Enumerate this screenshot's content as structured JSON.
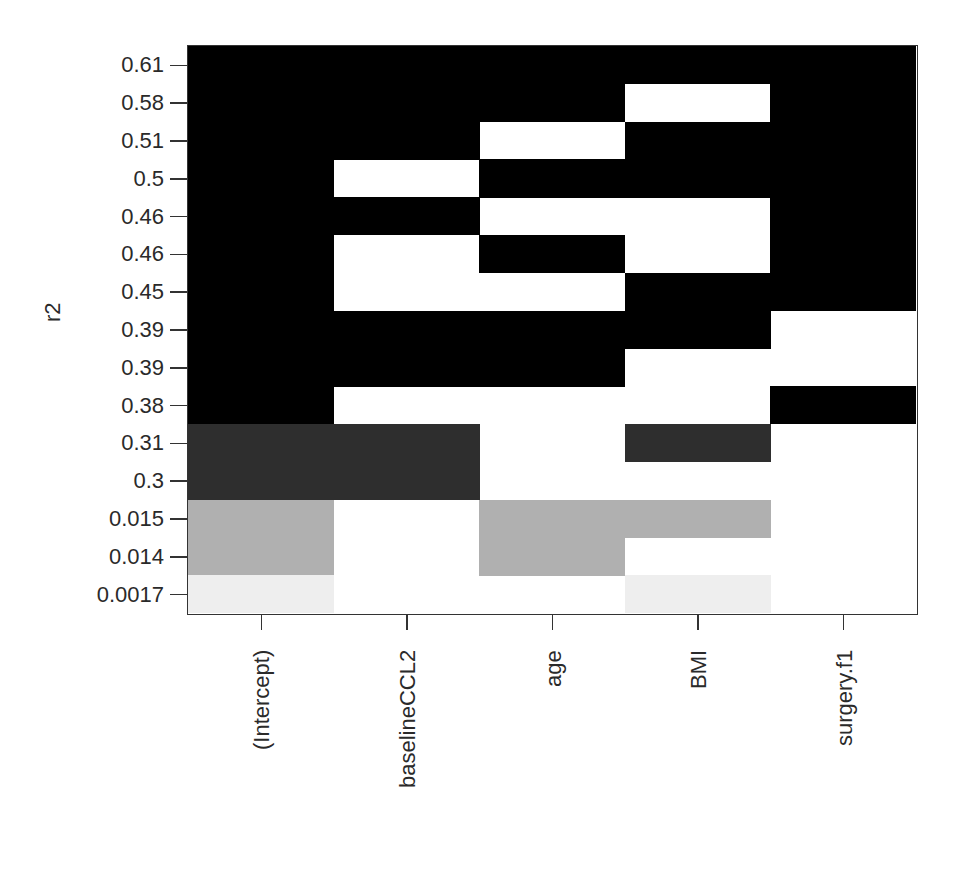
{
  "chart_data": {
    "type": "heatmap",
    "title": "",
    "xlabel": "",
    "ylabel": "r2",
    "columns": [
      "(Intercept)",
      "baselineCCL2",
      "age",
      "BMI",
      "surgery.f1"
    ],
    "rows": [
      "0.61",
      "0.58",
      "0.51",
      "0.5",
      "0.46",
      "0.46",
      "0.45",
      "0.39",
      "0.39",
      "0.38",
      "0.31",
      "0.3",
      "0.015",
      "0.014",
      "0.0017"
    ],
    "included": [
      [
        1,
        1,
        1,
        1,
        1
      ],
      [
        1,
        1,
        1,
        0,
        1
      ],
      [
        1,
        1,
        0,
        1,
        1
      ],
      [
        1,
        0,
        1,
        1,
        1
      ],
      [
        1,
        1,
        0,
        0,
        1
      ],
      [
        1,
        0,
        1,
        0,
        1
      ],
      [
        1,
        0,
        0,
        1,
        1
      ],
      [
        1,
        1,
        1,
        1,
        0
      ],
      [
        1,
        1,
        1,
        0,
        0
      ],
      [
        1,
        0,
        0,
        0,
        1
      ],
      [
        1,
        1,
        0,
        1,
        0
      ],
      [
        1,
        1,
        0,
        0,
        0
      ],
      [
        1,
        0,
        1,
        1,
        0
      ],
      [
        1,
        0,
        1,
        0,
        0
      ],
      [
        1,
        0,
        0,
        1,
        0
      ]
    ],
    "row_shades": [
      "#000000",
      "#000000",
      "#000000",
      "#000000",
      "#000000",
      "#000000",
      "#000000",
      "#000000",
      "#000000",
      "#000000",
      "#2e2e2e",
      "#2e2e2e",
      "#b0b0b0",
      "#b0b0b0",
      "#eeeeee"
    ],
    "legend": null,
    "grid": false
  },
  "axis": {
    "ylabel": "r2",
    "yticks": [
      "0.61",
      "0.58",
      "0.51",
      "0.5",
      "0.46",
      "0.46",
      "0.45",
      "0.39",
      "0.39",
      "0.38",
      "0.31",
      "0.3",
      "0.015",
      "0.014",
      "0.0017"
    ],
    "xticks": [
      "(Intercept)",
      "baselineCCL2",
      "age",
      "BMI",
      "surgery.f1"
    ]
  }
}
